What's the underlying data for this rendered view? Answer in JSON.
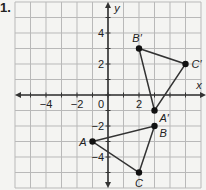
{
  "problem_number": "1.",
  "graph": {
    "x_axis_label": "x",
    "y_axis_label": "y",
    "origin_label": "0",
    "x_range": [
      -6,
      6
    ],
    "y_range": [
      -6,
      6
    ],
    "x_tick_labels": [
      {
        "value": -4,
        "label": "−4"
      },
      {
        "value": -2,
        "label": "−2"
      },
      {
        "value": 2,
        "label": "2"
      }
    ],
    "y_tick_labels": [
      {
        "value": 4,
        "label": "4"
      },
      {
        "value": 2,
        "label": "2"
      },
      {
        "value": -2,
        "label": "−2"
      },
      {
        "value": -4,
        "label": "−4"
      }
    ],
    "colors": {
      "grid": "#b9b9b9",
      "axis": "#333333",
      "shape": "#333333",
      "point": "#111111"
    },
    "triangles": [
      {
        "name": "ABC",
        "points": [
          {
            "label": "A",
            "x": -1,
            "y": -3,
            "label_pos": "left"
          },
          {
            "label": "B",
            "x": 3,
            "y": -2,
            "label_pos": "below-right"
          },
          {
            "label": "C",
            "x": 2,
            "y": -5,
            "label_pos": "below"
          }
        ]
      },
      {
        "name": "A'B'C'",
        "points": [
          {
            "label": "A′",
            "x": 3,
            "y": -1,
            "label_pos": "below-right"
          },
          {
            "label": "B′",
            "x": 2,
            "y": 3,
            "label_pos": "above"
          },
          {
            "label": "C′",
            "x": 5,
            "y": 2,
            "label_pos": "right"
          }
        ]
      }
    ]
  }
}
